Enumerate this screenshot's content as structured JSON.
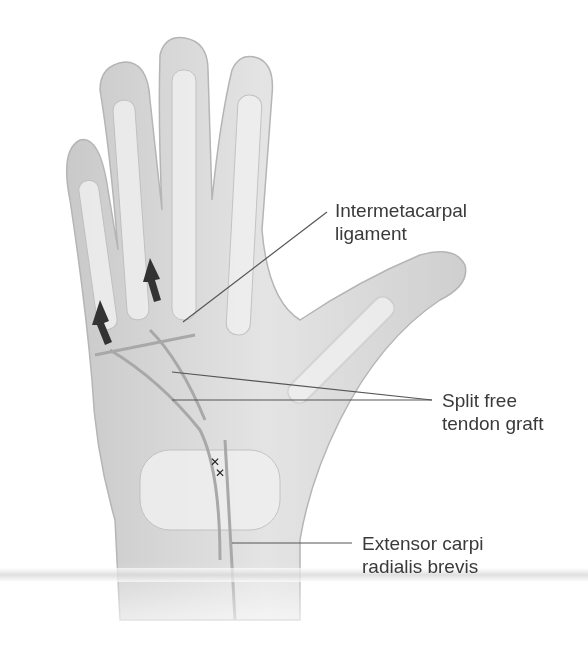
{
  "figure": {
    "labels": [
      {
        "id": "intermetacarpal",
        "lines": [
          "Intermetacarpal",
          "ligament"
        ]
      },
      {
        "id": "split-graft",
        "lines": [
          "Split free",
          "tendon graft"
        ]
      },
      {
        "id": "ecrb",
        "lines": [
          "Extensor carpi",
          "radialis brevis"
        ]
      }
    ],
    "colors": {
      "skin": "#d9d9d9",
      "bone": "#f2f2f2",
      "text": "#3a3a3a",
      "arrow": "#333333",
      "leader": "#555555"
    }
  }
}
